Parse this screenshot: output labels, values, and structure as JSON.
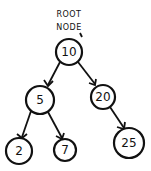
{
  "diagram": {
    "type": "binary-search-tree",
    "annotation": {
      "line1": "ROOT",
      "line2": "NODE"
    },
    "nodes": [
      {
        "id": "n10",
        "value": "10",
        "cx": 69,
        "cy": 52,
        "r": 13
      },
      {
        "id": "n5",
        "value": "5",
        "cx": 40,
        "cy": 100,
        "r": 14
      },
      {
        "id": "n20",
        "value": "20",
        "cx": 103,
        "cy": 97,
        "r": 12
      },
      {
        "id": "n2",
        "value": "2",
        "cx": 19,
        "cy": 151,
        "r": 13
      },
      {
        "id": "n7",
        "value": "7",
        "cx": 65,
        "cy": 150,
        "r": 11
      },
      {
        "id": "n25",
        "value": "25",
        "cx": 129,
        "cy": 143,
        "r": 15
      }
    ],
    "edges": [
      {
        "from": "10",
        "to": "5"
      },
      {
        "from": "10",
        "to": "20"
      },
      {
        "from": "5",
        "to": "2"
      },
      {
        "from": "5",
        "to": "7"
      },
      {
        "from": "20",
        "to": "25"
      }
    ],
    "colors": {
      "stroke": "#111111",
      "background": "#ffffff"
    }
  }
}
